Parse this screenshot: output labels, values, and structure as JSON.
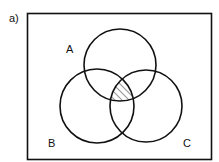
{
  "figure": {
    "part_label": "a)"
  },
  "sets": [
    {
      "name": "A",
      "label": "A"
    },
    {
      "name": "B",
      "label": "B"
    },
    {
      "name": "C",
      "label": "C"
    }
  ],
  "shaded_region": "A ∩ B ∩ C",
  "colors": {
    "stroke": "#111111",
    "background": "#ffffff",
    "hatch": "#333333"
  }
}
